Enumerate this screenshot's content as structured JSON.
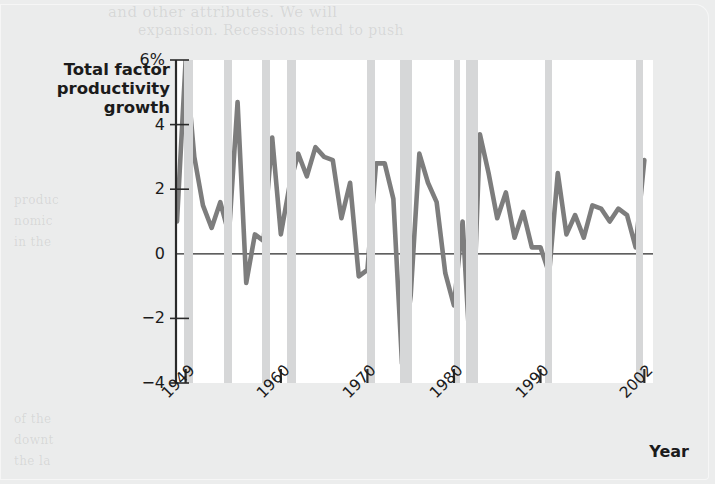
{
  "figure": {
    "y_axis_title": "Total factor\nproductivity\ngrowth",
    "x_axis_title": "Year",
    "line_color": "#7d7d7d",
    "recession_band_color": "#d6d7d8",
    "plot_background": "#ffffff",
    "page_background": "#ebecec"
  },
  "ghost_text": {
    "l1": "and other attributes. We will",
    "l2": "expansion. Recessions tend to push",
    "l3": "produc",
    "l4": "nomic",
    "l5": "in the",
    "l6": "of the",
    "l7": "downt",
    "l8": "the la",
    "l9": "such",
    "l10": "firms"
  },
  "chart_data": {
    "type": "line",
    "title": "",
    "xlabel": "Year",
    "ylabel": "Total factor productivity growth",
    "xlim": [
      1948,
      2003
    ],
    "ylim": [
      -4,
      6
    ],
    "yticks": [
      -4,
      -2,
      0,
      2,
      4,
      6
    ],
    "ytick_labels": [
      "-4",
      "-2",
      "0",
      "2",
      "4",
      "6%"
    ],
    "xticks": [
      1949,
      1960,
      1970,
      1980,
      1990,
      2002
    ],
    "xtick_labels": [
      "1949",
      "1960",
      "1970",
      "1980",
      "1990",
      "2002"
    ],
    "grid": false,
    "legend": false,
    "zero_line": true,
    "units": "percent",
    "series": [
      {
        "name": "Total factor productivity growth",
        "color": "#7d7d7d",
        "x": [
          1948,
          1949,
          1950,
          1951,
          1952,
          1953,
          1954,
          1955,
          1956,
          1957,
          1958,
          1959,
          1960,
          1961,
          1962,
          1963,
          1964,
          1965,
          1966,
          1967,
          1968,
          1969,
          1970,
          1971,
          1972,
          1973,
          1974,
          1975,
          1976,
          1977,
          1978,
          1979,
          1980,
          1981,
          1982,
          1983,
          1984,
          1985,
          1986,
          1987,
          1988,
          1989,
          1990,
          1991,
          1992,
          1993,
          1994,
          1995,
          1996,
          1997,
          1998,
          1999,
          2000,
          2001,
          2002
        ],
        "values": [
          1.0,
          6.0,
          3.0,
          1.5,
          0.8,
          1.6,
          0.6,
          4.7,
          -0.9,
          0.6,
          0.4,
          3.6,
          0.6,
          2.1,
          3.1,
          2.4,
          3.3,
          3.0,
          2.9,
          1.1,
          2.2,
          -0.7,
          -0.5,
          2.8,
          2.8,
          1.7,
          -3.4,
          -1.3,
          3.1,
          2.2,
          1.6,
          -0.6,
          -1.6,
          1.0,
          -3.7,
          3.7,
          2.5,
          1.1,
          1.9,
          0.5,
          1.3,
          0.2,
          0.2,
          -0.6,
          2.5,
          0.6,
          1.2,
          0.5,
          1.5,
          1.4,
          1.0,
          1.4,
          1.2,
          0.2,
          2.9
        ]
      }
    ],
    "recession_bands": [
      {
        "start": 1948.8,
        "end": 1949.9
      },
      {
        "start": 1953.4,
        "end": 1954.3
      },
      {
        "start": 1957.8,
        "end": 1958.7
      },
      {
        "start": 1960.7,
        "end": 1961.7
      },
      {
        "start": 1969.9,
        "end": 1970.9
      },
      {
        "start": 1973.8,
        "end": 1975.1
      },
      {
        "start": 1980.0,
        "end": 1980.7
      },
      {
        "start": 1981.4,
        "end": 1982.8
      },
      {
        "start": 1990.5,
        "end": 1991.3
      },
      {
        "start": 2001.0,
        "end": 2001.9
      }
    ]
  }
}
